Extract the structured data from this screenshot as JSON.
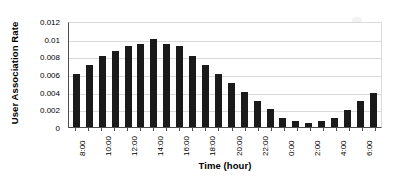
{
  "chart_data": {
    "type": "bar",
    "title": "",
    "xlabel": "Time (hour)",
    "ylabel": "User Association Rate",
    "categories": [
      "8:00",
      "9:00",
      "10:00",
      "11:00",
      "12:00",
      "13:00",
      "14:00",
      "15:00",
      "16:00",
      "17:00",
      "18:00",
      "19:00",
      "20:00",
      "21:00",
      "22:00",
      "23:00",
      "0:00",
      "1:00",
      "2:00",
      "3:00",
      "4:00",
      "5:00",
      "6:00",
      "7:00"
    ],
    "values": [
      0.006,
      0.007,
      0.008,
      0.0086,
      0.0092,
      0.0094,
      0.01,
      0.0094,
      0.0092,
      0.008,
      0.007,
      0.006,
      0.005,
      0.004,
      0.003,
      0.002,
      0.001,
      0.0007,
      0.0005,
      0.0007,
      0.001,
      0.0019,
      0.0029,
      0.0039
    ],
    "tick_labels": [
      "8:00",
      "",
      "10:00",
      "",
      "12:00",
      "",
      "14:00",
      "",
      "16:00",
      "",
      "18:00",
      "",
      "20:00",
      "",
      "22:00",
      "",
      "0:00",
      "",
      "2:00",
      "",
      "4:00",
      "",
      "6:00",
      ""
    ],
    "yticks": [
      0,
      0.002,
      0.004,
      0.006,
      0.008,
      0.01,
      0.012
    ],
    "ytick_labels": [
      "0",
      "0.002",
      "0.004",
      "0.006",
      "0.008",
      "0.01",
      "0.012"
    ],
    "ylim": [
      0,
      0.012
    ],
    "grid": true,
    "legend": "none",
    "bar_color": "#1a1a1a",
    "gridline_color": "#d9d9d9",
    "axis_color": "#4d4d4d"
  }
}
